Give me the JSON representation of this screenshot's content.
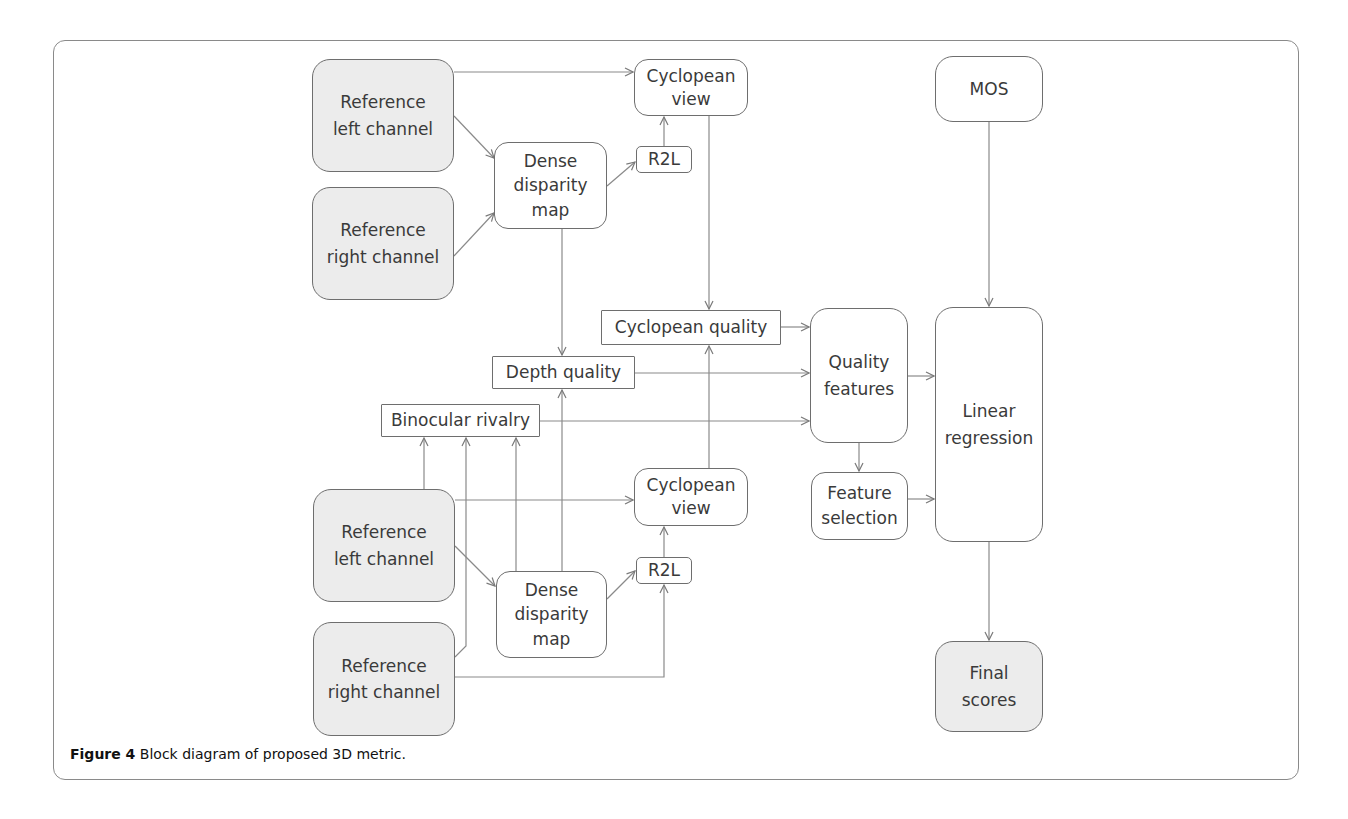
{
  "figure": {
    "caption_label": "Figure 4",
    "caption_text": " Block diagram of proposed 3D metric."
  },
  "nodes": {
    "ref_left_top": "Reference\nleft channel",
    "ref_right_top": "Reference\nright channel",
    "dense_top": "Dense\ndisparity\nmap",
    "r2l_top": "R2L",
    "cyclopean_view_top": "Cyclopean\nview",
    "mos": "MOS",
    "cyclopean_quality": "Cyclopean quality",
    "depth_quality": "Depth quality",
    "binocular_rivalry": "Binocular rivalry",
    "quality_features": "Quality\nfeatures",
    "feature_selection": "Feature\nselection",
    "linear_regression": "Linear\nregression",
    "ref_left_bottom": "Reference\nleft channel",
    "ref_right_bottom": "Reference\nright channel",
    "dense_bottom": "Dense\ndisparity\nmap",
    "r2l_bottom": "R2L",
    "cyclopean_view_bottom": "Cyclopean\nview",
    "final_scores": "Final\nscores"
  },
  "colors": {
    "line": "#7a7a7a",
    "input_fill": "#ececec",
    "border": "#6e6e6e"
  }
}
